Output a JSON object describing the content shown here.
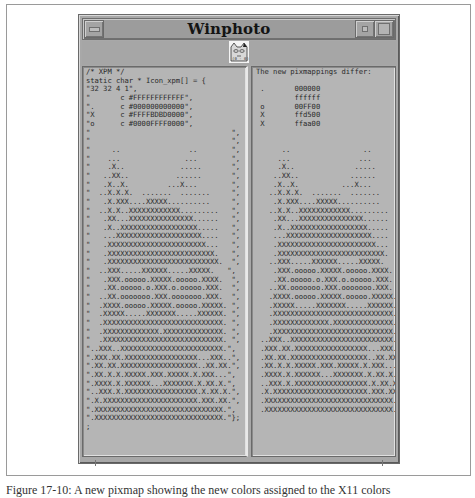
{
  "window": {
    "title": "Winphoto",
    "titlebar_buttons": {
      "menu": "window-menu-button",
      "minimize": "minimize-button",
      "maximize": "maximize-button"
    },
    "icon": "cat-face-icon"
  },
  "left_pane": {
    "lines": [
      "/* XPM */",
      "static char * Icon_xpm[] = {",
      "\"32 32 4 1\",",
      "\"       c #FFFFFFFFFFFF\",",
      "\".      c #000000000000\",",
      "\"X      c #FFFFBDBD0000\",",
      "\"o      c #0000FFFF0000\",",
      "\"                                 \",",
      "\"                                 \",",
      "\"     ..                ..        \",",
      "\"    ...               ...        \",",
      "\"    .X..             .....       \",",
      "\"   ..XX..           ......       \",",
      "\"   .X..X.         ...X...        \",",
      "\"  ..X.X.X.  .......  .......     \",",
      "\"   .X.XXX....XXXXX..........     \",",
      "\"  ..X.X..XXXXXXXXXXXX.........   \",",
      "\"   .XX...XXXXXXXXXXXXXXX......   \",",
      "\"   .X..XXXXXXXXXXXXXXXXXX.....   \",",
      "\"   ...XXXXXXXXXXXXXXXXXXXX....   \",",
      "\"   .XXXXXXXXXXXXXXXXXXXXXXX...   \",",
      "\"   .XXXXXXXXXXXXXXXXXXXXXXXXX.   \",",
      "\"   .XXXXXXXXXXXXXXXXXXXXXXXXXX.  \",",
      "\"  ..XXX.....XXXXXX.....XXXXX.   \",",
      "\"   .XXX.ooooo.XXXXX.ooooo.XXXX.  \",",
      "\"   .XX.ooooo.o.XXX.o.ooooo.XXX.  \",",
      "\"  ..XX.ooooooo.XXX.ooooooo.XXX.  \",",
      "\"  .XXXX.ooooo.XXXXX.ooooo.XXXXX. \",",
      "\"  .XXXXX.....XXXXXXX.....XXXXXX. \",",
      "\"  .XXXXXXXXXXXXXXXXXXXXXXXXXXXX. \",",
      "\"  .XXXXXXXXXXXXX.XXXXXXXXXXXXXX. \",",
      "\"  .XXXXXXXXXXXXXXXXXXXXXXXXXXXX. \",",
      "\"..XXX..XXXXXXXXXXXXXXXXXXXXXXXX.\",",
      "\".XXX.XX.XXXXXXXXXXXXXXXXX...XXX..\",",
      "\".XX.XX.XXXXXXXXXXXXXXXXXX..XX.XX.\",",
      "\".XX.X.X.XXXXX.XXX.XXXXX.X.XXX...\",",
      "\".XXXX.X.XXXXXX...XXXXXXX.X.XX.X.\",",
      "\"..XXX.X.XXXXXXXXXXXXXXXXX.X.XX.X.\",",
      "\".X.XXXXXXXXXXXXXXXXXXXXXX.XXX.XX.\",",
      "\".XXXXXXXXXXXXXXXXXXXXXXXXXXXXXX.\",",
      "\".XXXXXXXXXXXXXXXXXXXXXXXXXXXXXX.\"};",
      ";"
    ]
  },
  "right_pane": {
    "lines": [
      "The new pixmappings differ:",
      "",
      " .       000000",
      "         ffffff",
      " o       00FF00",
      " X       ffd500",
      " X       ffaa00",
      "",
      "",
      "      ..                 ..",
      "     ...                ...",
      "     .X..              .....",
      "    ..XX..            ......",
      "    .X..X.          ...X...",
      "   ..X.X.X.  .......  .......",
      "    .X.XXX....XXXXX..........",
      "   ..X.X..XXXXXXXXXXXX.........",
      "    .XX...XXXXXXXXXXXXXXX......",
      "    .X..XXXXXXXXXXXXXXXXXX.....",
      "    ...XXXXXXXXXXXXXXXXXXXX....",
      "    .XXXXXXXXXXXXXXXXXXXXXXX...",
      "    .XXXXXXXXXXXXXXXXXXXXXXXXX.",
      "   ..XXX.....XXXXXX.....XXXXX.",
      "    .XXX.ooooo.XXXXX.ooooo.XXXX.",
      "    .XX.ooooo.o.XXX.o.ooooo.XXX.",
      "   ..XX.ooooooo.XXX.ooooooo.XXX.",
      "   .XXXX.ooooo.XXXXX.ooooo.XXXXX.",
      "   .XXXXX.....XXXXXXX.....XXXXXX.",
      "   .XXXXXXXXXXXXXXXXXXXXXXXXXXXX.",
      "   .XXXXXXXXXXXXX.XXXXXXXXXXXXXX.",
      "   .XXXXXXXXXXXXXXXXXXXXXXXXXXXX.",
      " ..XXX..XXXXXXXXXXXXXXXXXXXXXXXX.",
      " .XXX.XX.XXXXXXXXXXXXXXXXX...XXX..",
      " .XX.XX.XXXXXXXXXXXXXXXXXX..XX.XX.",
      " .XX.X.X.XXXXX.XXX.XXXXX.X.XXX...",
      " .XXXX.X.XXXXXX...XXXXXXX.X.XX.X.",
      " ..XXX.X.XXXXXXXXXXXXXXXXX.X.XX.X.",
      " .X.XXXXXXXXXXXXXXXXXXXXXX.XXX.XX.",
      " .XXXXXXXXXXXXXXXXXXXXXXXXXXXXXX.",
      " .XXXXXXXXXXXXXXXXXXXXXXXXXXXXXX."
    ]
  },
  "caption": "Figure 17-10: A new pixmap showing the new colors assigned to the X11 colors"
}
